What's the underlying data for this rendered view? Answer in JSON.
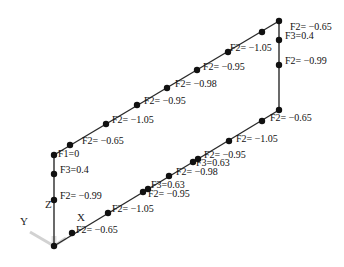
{
  "diagram": {
    "type": "3d-frame-force-diagram",
    "axes": {
      "x": "X",
      "y": "Y",
      "z": "Z"
    },
    "colors": {
      "line": "#2a2a2a",
      "node": "#111111",
      "text": "#111111",
      "triad": "#c8c8c8"
    },
    "segments": [
      {
        "id": "left-column",
        "from": [
          54,
          246
        ],
        "to": [
          54,
          155
        ]
      },
      {
        "id": "top-left-beam",
        "from": [
          54,
          155
        ],
        "to": [
          279,
          21
        ]
      },
      {
        "id": "right-column",
        "from": [
          279,
          21
        ],
        "to": [
          279,
          110
        ]
      },
      {
        "id": "bottom-beam",
        "from": [
          54,
          246
        ],
        "to": [
          279,
          110
        ]
      }
    ],
    "nodes": [
      {
        "x": 54,
        "y": 246
      },
      {
        "x": 54,
        "y": 200
      },
      {
        "x": 54,
        "y": 174
      },
      {
        "x": 54,
        "y": 155
      },
      {
        "x": 70,
        "y": 145
      },
      {
        "x": 106,
        "y": 124
      },
      {
        "x": 137,
        "y": 105
      },
      {
        "x": 167,
        "y": 88
      },
      {
        "x": 197,
        "y": 70
      },
      {
        "x": 228,
        "y": 52
      },
      {
        "x": 262,
        "y": 32
      },
      {
        "x": 279,
        "y": 21
      },
      {
        "x": 279,
        "y": 40
      },
      {
        "x": 279,
        "y": 65
      },
      {
        "x": 279,
        "y": 110
      },
      {
        "x": 262,
        "y": 121
      },
      {
        "x": 229,
        "y": 141
      },
      {
        "x": 198,
        "y": 159
      },
      {
        "x": 193,
        "y": 162
      },
      {
        "x": 169,
        "y": 176
      },
      {
        "x": 148,
        "y": 189
      },
      {
        "x": 143,
        "y": 192
      },
      {
        "x": 108,
        "y": 213
      },
      {
        "x": 72,
        "y": 233
      }
    ],
    "labels": [
      {
        "text": "F2= −0.65",
        "x": 290,
        "y": 27
      },
      {
        "text": "F3=0.4",
        "x": 285,
        "y": 36
      },
      {
        "text": "F2= −1.05",
        "x": 230,
        "y": 48
      },
      {
        "text": "F2= −0.99",
        "x": 285,
        "y": 61
      },
      {
        "text": "F2= −0.95",
        "x": 203,
        "y": 67
      },
      {
        "text": "F2= −0.98",
        "x": 175,
        "y": 84
      },
      {
        "text": "F2= −0.95",
        "x": 144,
        "y": 101
      },
      {
        "text": "F2= −1.05",
        "x": 112,
        "y": 120
      },
      {
        "text": "F2= −0.65",
        "x": 82,
        "y": 141
      },
      {
        "text": "F1=0",
        "x": 58,
        "y": 154
      },
      {
        "text": "F3=0.4",
        "x": 60,
        "y": 170
      },
      {
        "text": "F2= −0.99",
        "x": 60,
        "y": 196
      },
      {
        "text": "F2= −0.65",
        "x": 270,
        "y": 118
      },
      {
        "text": "F2= −1.05",
        "x": 236,
        "y": 139
      },
      {
        "text": "F2= −0.95",
        "x": 204,
        "y": 155
      },
      {
        "text": "F3=0.63",
        "x": 196,
        "y": 163
      },
      {
        "text": "F2= −0.98",
        "x": 176,
        "y": 172
      },
      {
        "text": "F3=0.63",
        "x": 151,
        "y": 185
      },
      {
        "text": "F2= −0.95",
        "x": 148,
        "y": 194
      },
      {
        "text": "F2= −1.05",
        "x": 112,
        "y": 209
      },
      {
        "text": "F2= −0.65",
        "x": 76,
        "y": 230
      }
    ]
  },
  "axis_labels": {
    "z": {
      "text": "Z",
      "x": 45,
      "y": 205
    },
    "x": {
      "text": "X",
      "x": 77,
      "y": 218
    },
    "y": {
      "text": "Y",
      "x": 20,
      "y": 222
    }
  }
}
